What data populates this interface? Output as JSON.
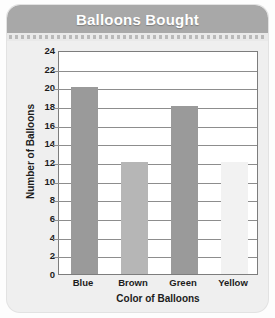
{
  "card": {
    "title": "Balloons Bought"
  },
  "chart_data": {
    "type": "bar",
    "title": "Balloons Bought",
    "xlabel": "Color of Balloons",
    "ylabel": "Number of Balloons",
    "categories": [
      "Blue",
      "Brown",
      "Green",
      "Yellow"
    ],
    "values": [
      20,
      12,
      18,
      12
    ],
    "bar_colors": [
      "#9a9a9a",
      "#b6b6b6",
      "#9a9a9a",
      "#f2f2f2"
    ],
    "ylim": [
      0,
      24
    ],
    "ytick_step": 2,
    "yticks": [
      24,
      22,
      20,
      18,
      16,
      14,
      12,
      10,
      8,
      6,
      4,
      2,
      0
    ],
    "grid": true,
    "legend": false
  },
  "colors": {
    "title_bar": "#a8a8a8",
    "title_text": "#ffffff",
    "card_background": "#efefef",
    "plot_background": "#ffffff",
    "plot_border": "#7d7d7d",
    "gridline": "#8d8d8d",
    "axis_text": "#1c1c1c"
  }
}
